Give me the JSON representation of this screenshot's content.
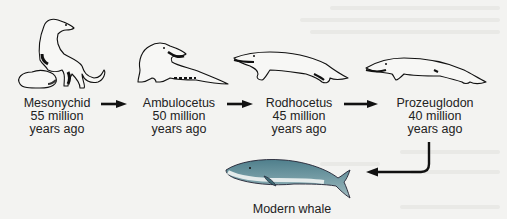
{
  "diagram": {
    "type": "evolutionary-sequence",
    "stages": [
      {
        "name": "Mesonychid",
        "age": "55 million",
        "unit": "years ago"
      },
      {
        "name": "Ambulocetus",
        "age": "50 million",
        "unit": "years ago"
      },
      {
        "name": "Rodhocetus",
        "age": "45 million",
        "unit": "years ago"
      },
      {
        "name": "Prozeuglodon",
        "age": "40 million",
        "unit": "years ago"
      }
    ],
    "final": {
      "name": "Modern whale"
    },
    "colors": {
      "background": "#f3f3f1",
      "text": "#222222",
      "arrow": "#111111",
      "whale_body": "#5f8e9a",
      "whale_belly": "#dfe6e6"
    }
  }
}
